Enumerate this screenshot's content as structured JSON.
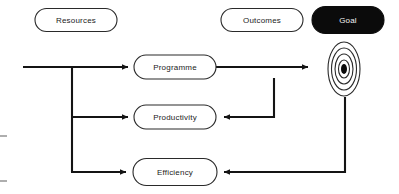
{
  "diagram": {
    "background_color": "#ffffff",
    "line_color": "#141414",
    "node_stroke_color": "#2a2a2a",
    "node_fill_color": "#ffffff",
    "goal_fill_color": "#0b0b0b",
    "goal_text_color": "#f2f2f2",
    "label_text_color": "#1b1b1b"
  },
  "headers": [
    {
      "id": "resources",
      "label": "Resources",
      "x": 76,
      "y": 20,
      "w": 82,
      "h": 23,
      "filled": false
    },
    {
      "id": "outcomes",
      "label": "Outcomes",
      "x": 262,
      "y": 20,
      "w": 82,
      "h": 23,
      "filled": false
    },
    {
      "id": "goal",
      "label": "Goal",
      "x": 348,
      "y": 20,
      "w": 72,
      "h": 27,
      "filled": true
    }
  ],
  "nodes": [
    {
      "id": "programme",
      "label": "Programme",
      "x": 175,
      "y": 67,
      "w": 82,
      "h": 24,
      "filled": false
    },
    {
      "id": "productivity",
      "label": "Productivity",
      "x": 175,
      "y": 117,
      "w": 82,
      "h": 24,
      "filled": false
    },
    {
      "id": "efficiency",
      "label": "Efficiency",
      "x": 175,
      "y": 172,
      "w": 84,
      "h": 27,
      "filled": false
    }
  ],
  "target_icon": {
    "id": "goal-target",
    "name": "bullseye-target-icon",
    "cx": 344,
    "cy": 69,
    "rings": [
      {
        "rx": 16,
        "ry": 27
      },
      {
        "rx": 12.5,
        "ry": 21
      },
      {
        "rx": 9,
        "ry": 15
      },
      {
        "rx": 5.5,
        "ry": 9
      }
    ],
    "core": {
      "rx": 3,
      "ry": 5
    }
  },
  "flows": [
    {
      "id": "input-to-programme",
      "from": "input",
      "to": "programme",
      "path": "M 23 67 L 128 67",
      "arrow": "right",
      "arrow_at": [
        134,
        67
      ]
    },
    {
      "id": "branch-trunk",
      "from": "input",
      "to": "branch",
      "path": "M 72 68 L 72 172",
      "arrow": "none",
      "arrow_at": null
    },
    {
      "id": "branch-to-productivity",
      "from": "branch",
      "to": "productivity",
      "path": "M 72 117 L 128 117",
      "arrow": "right",
      "arrow_at": [
        134,
        117
      ]
    },
    {
      "id": "branch-to-efficiency",
      "from": "branch",
      "to": "efficiency",
      "path": "M 71 172 L 126 172",
      "arrow": "right",
      "arrow_at": [
        132,
        172
      ]
    },
    {
      "id": "programme-to-goal",
      "from": "programme",
      "to": "goal-target",
      "path": "M 216 67 L 308 67",
      "arrow": "right",
      "arrow_at": [
        314,
        67
      ]
    },
    {
      "id": "outcomes-feedback-to-productivity",
      "from": "programme-path",
      "to": "productivity",
      "path": "M 274 78 L 274 117 L 224 117",
      "arrow": "left",
      "arrow_at": [
        218,
        117
      ]
    },
    {
      "id": "goal-feedback-to-efficiency",
      "from": "goal-target",
      "to": "efficiency",
      "path": "M 345 97 L 345 172 L 224 172",
      "arrow": "left",
      "arrow_at": [
        218,
        172
      ]
    }
  ],
  "edge_marks": [
    {
      "id": "left-edge-mark-1",
      "x": 0,
      "y": 136,
      "w": 7
    },
    {
      "id": "left-edge-mark-2",
      "x": 0,
      "y": 181,
      "w": 7
    }
  ]
}
